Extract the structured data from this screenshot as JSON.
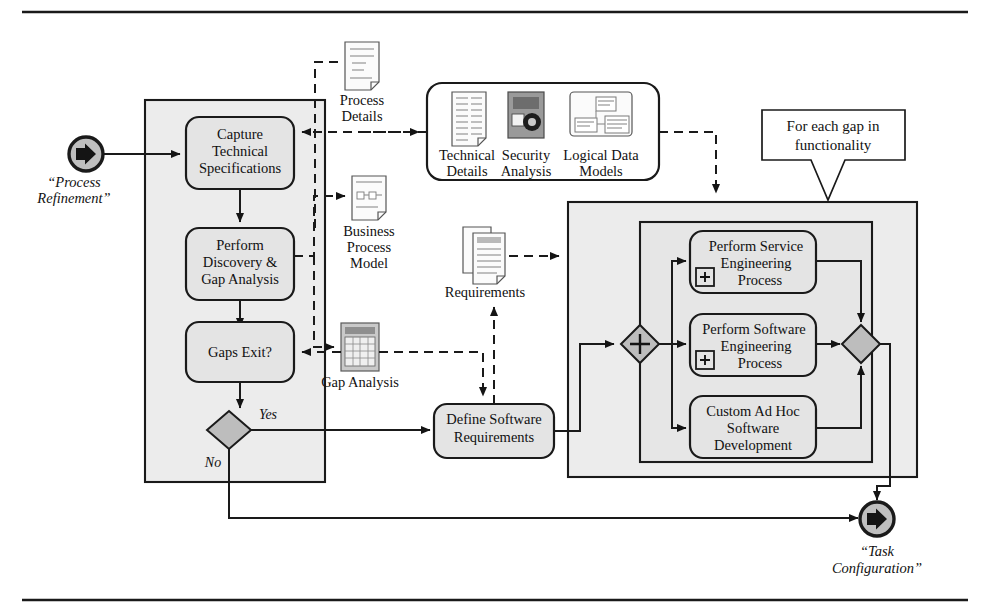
{
  "figure": {
    "start_event": {
      "label": "“Process\nRefinement”",
      "line1": "“Process",
      "line2": "Refinement”",
      "icon": "start-event-arrow-icon"
    },
    "end_event": {
      "line1": "“Task",
      "line2": "Configuration”",
      "icon": "end-event-arrow-icon"
    }
  },
  "tasks": {
    "capture": {
      "l1": "Capture",
      "l2": "Technical",
      "l3": "Specifications"
    },
    "discovery": {
      "l1": "Perform",
      "l2": "Discovery &",
      "l3": "Gap Analysis"
    },
    "gaps": {
      "l1": "Gaps Exit?"
    },
    "define": {
      "l1": "Define Software",
      "l2": "Requirements"
    },
    "service": {
      "l1": "Perform Service",
      "l2": "Engineering",
      "l3": "Process",
      "marker": "+"
    },
    "software": {
      "l1": "Perform Software",
      "l2": "Engineering",
      "l3": "Process",
      "marker": "+"
    },
    "adhoc": {
      "l1": "Custom Ad Hoc",
      "l2": "Software",
      "l3": "Development"
    }
  },
  "gateways": {
    "decision": {
      "label": "",
      "yes": "Yes",
      "no": "No"
    },
    "split": {
      "marker": "+"
    },
    "join": {
      "marker": ""
    }
  },
  "artifacts": {
    "process_details": {
      "l1": "Process",
      "l2": "Details",
      "icon": "document-icon"
    },
    "business_process_model": {
      "l1": "Business",
      "l2": "Process",
      "l3": "Model",
      "icon": "diagram-document-icon"
    },
    "gap_analysis": {
      "l1": "Gap Analysis",
      "icon": "spreadsheet-icon"
    },
    "requirements": {
      "l1": "Requirements",
      "icon": "multi-document-icon"
    },
    "technical_details": {
      "l1": "Technical",
      "l2": "Details",
      "icon": "spec-document-icon"
    },
    "security_analysis": {
      "l1": "Security",
      "l2": "Analysis",
      "icon": "security-lock-icon"
    },
    "logical_data_models": {
      "l1": "Logical Data",
      "l2": "Models",
      "icon": "data-model-icon"
    }
  },
  "annotation": {
    "l1": "For each gap in",
    "l2": "functionality"
  },
  "colors": {
    "lane_fill": "#ececec",
    "task_fill": "#e4e4e4",
    "gateway_fill": "#bdbdbd",
    "event_fill": "#bfbfbf",
    "stroke": "#1a1a1a",
    "page": "#ffffff"
  }
}
